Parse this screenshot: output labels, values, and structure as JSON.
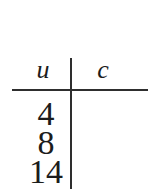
{
  "table": {
    "columns": [
      {
        "label": "u"
      },
      {
        "label": "c"
      }
    ],
    "rows": [
      {
        "u": "4",
        "c": ""
      },
      {
        "u": "8",
        "c": ""
      },
      {
        "u": "14",
        "c": ""
      }
    ]
  },
  "chart_data": {
    "type": "table",
    "columns": [
      "u",
      "c"
    ],
    "rows": [
      [
        "4",
        ""
      ],
      [
        "8",
        ""
      ],
      [
        "14",
        ""
      ]
    ]
  },
  "colors": {
    "background": "#ffffff",
    "text": "#1c1c1c",
    "rule_line": "#2e2e2e"
  }
}
